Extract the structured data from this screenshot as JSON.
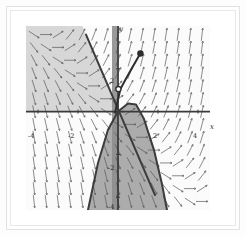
{
  "figure": {
    "kind": "slope-field-plot",
    "background": "#ffffff",
    "frame_color": "#e4e4e4"
  },
  "axes": {
    "x_label": "x",
    "y_label": "y",
    "x_ticks": [
      {
        "value": -4,
        "label": "-4"
      },
      {
        "value": -2,
        "label": "-2"
      },
      {
        "value": 2,
        "label": "2"
      },
      {
        "value": 4,
        "label": "4"
      }
    ],
    "y_ticks": [
      {
        "value": 2,
        "label": "2"
      },
      {
        "value": -2,
        "label": "-2"
      },
      {
        "value": -4,
        "label": "-4"
      }
    ],
    "axis_color": "#3a3a3a"
  },
  "chart_data": {
    "type": "line",
    "title": "",
    "xlabel": "x",
    "ylabel": "y",
    "xlim": [
      -4.6,
      4.6
    ],
    "ylim": [
      -4.6,
      4.0
    ],
    "grid": false,
    "legend": "none",
    "vector_field": {
      "name": "slope-field",
      "arrow_color": "#555555",
      "x_range": [
        -4.2,
        4.2
      ],
      "y_range": [
        -4.2,
        3.6
      ],
      "spacing": 0.6
    },
    "regions": [
      {
        "name": "upper-left-shaded-region",
        "fill": "#d7d7d7",
        "description": "region left of the line y = -2x and above the x-axis"
      },
      {
        "name": "lower-parabolic-shaded-region",
        "fill": "#a8a8a8",
        "description": "region below the x-axis bounded by the parabola"
      },
      {
        "name": "narrow-vertical-band",
        "fill": "#8e8e8e",
        "description": "thin vertical band just left of the y-axis"
      }
    ],
    "curves": [
      {
        "name": "straight-line",
        "color": "#3c3c3c",
        "width": 2,
        "points": [
          [
            -1.6,
            3.6
          ],
          [
            1.85,
            -3.9
          ]
        ]
      },
      {
        "name": "parabola",
        "color": "#3c3c3c",
        "width": 2,
        "points": [
          [
            -1.5,
            -4.6
          ],
          [
            -1.0,
            -2.4
          ],
          [
            -0.5,
            -0.85
          ],
          [
            0.0,
            0.0
          ],
          [
            0.5,
            0.38
          ],
          [
            0.9,
            0.33
          ],
          [
            1.3,
            -0.35
          ],
          [
            1.8,
            -1.8
          ],
          [
            2.2,
            -3.4
          ],
          [
            2.45,
            -4.6
          ]
        ]
      },
      {
        "name": "solution-trajectory",
        "color": "#2e2e2e",
        "width": 2,
        "points": [
          [
            -0.15,
            -0.05
          ],
          [
            0.0,
            0.55
          ],
          [
            0.12,
            1.05
          ],
          [
            0.35,
            1.45
          ],
          [
            0.65,
            1.95
          ],
          [
            0.95,
            2.45
          ],
          [
            1.12,
            2.72
          ]
        ]
      }
    ],
    "markers": [
      {
        "name": "initial-condition-point",
        "x": 0.02,
        "y": 1.05,
        "style": "open-circle",
        "color": "#2e2e2e"
      },
      {
        "name": "endpoint-point",
        "x": 1.12,
        "y": 2.72,
        "style": "filled-circle",
        "color": "#2e2e2e"
      }
    ]
  }
}
